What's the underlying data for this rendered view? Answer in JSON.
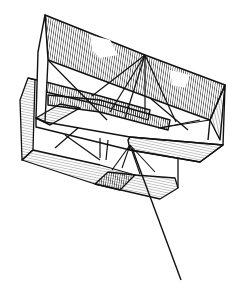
{
  "illustration": {
    "subject": "box kite with string",
    "style": "black and white line engraving with hatched shading",
    "colors": {
      "background": "#ffffff",
      "ink": "#111111",
      "hatch": "#2a2a2a"
    },
    "parts": [
      "front-cell",
      "rear-cell",
      "cross-bracing",
      "bridle",
      "kite-string"
    ]
  }
}
